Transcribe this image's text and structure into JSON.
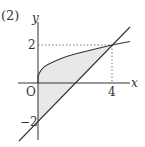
{
  "problem_label": "(2)",
  "axes": {
    "x_label": "x",
    "y_label": "y",
    "origin_label": "O"
  },
  "ticks": {
    "x_tick": "4",
    "y_tick_pos": "2",
    "y_tick_neg": "−2"
  },
  "curves": [
    {
      "name": "sqrt-curve",
      "equation": "y = √x"
    },
    {
      "name": "line",
      "equation": "y = x - 2"
    }
  ],
  "shaded_region": "between y=√x and y=x-2 for 0 ≤ x ≤ 4",
  "intersection": {
    "x": 4,
    "y": 2
  },
  "colors": {
    "stroke": "#333333",
    "fill": "#e6e6e6",
    "dotted": "#555555"
  }
}
